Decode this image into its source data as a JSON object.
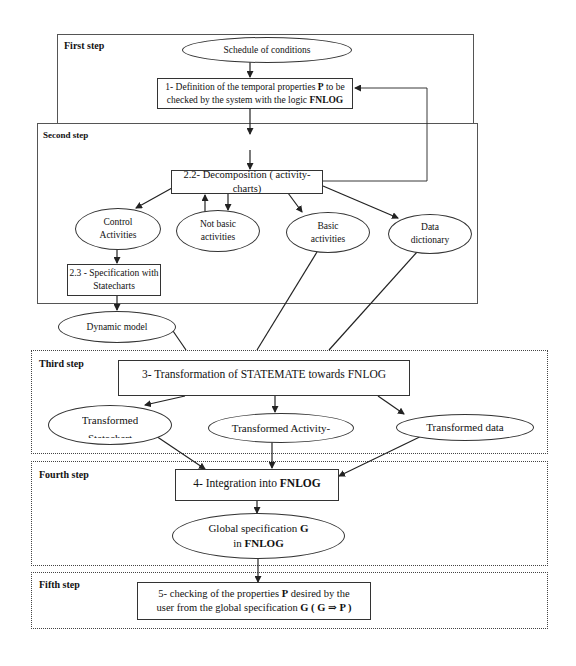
{
  "steps": {
    "first": "First step",
    "second": "Second step",
    "third": "Third step",
    "fourth": "Fourth step",
    "fifth": "Fifth step"
  },
  "nodes": {
    "schedule": "Schedule of conditions",
    "definition_line1_pre": "1- Definition of the temporal properties ",
    "definition_line1_bold": "P",
    "definition_line1_post": " to be",
    "definition_line2_pre": "checked by the system with the logic ",
    "definition_line2_bold": "FNLOG",
    "decomposition": "2.2- Decomposition  ( activity-charts)",
    "control_activities_1": "Control",
    "control_activities_2": "Activities",
    "not_basic_1": "Not basic",
    "not_basic_2": "activities",
    "basic_1": "Basic",
    "basic_2": "activities",
    "data_dict_1": "Data",
    "data_dict_2": "dictionary",
    "spec_statecharts_1": "2.3 - Specification with",
    "spec_statecharts_2": "Statecharts",
    "dynamic_model": "Dynamic model",
    "transformation": "3- Transformation of STATEMATE towards FNLOG",
    "transformed_statechart_1": "Transformed",
    "transformed_statechart_2": "Statechart",
    "transformed_activity": "Transformed Activity-",
    "transformed_data": "Transformed data",
    "integration_pre": "4- Integration into ",
    "integration_bold": "FNLOG",
    "global_spec_1_pre": "Global specification  ",
    "global_spec_1_bold": "G",
    "global_spec_2_pre": "in ",
    "global_spec_2_bold": "FNLOG",
    "checking_line1_pre": "5- checking  of the properties ",
    "checking_line1_bold": "P",
    "checking_line1_post": " desired by the",
    "checking_line2_pre": "user from the global specification  ",
    "checking_line2_bold": "G ( G ⇒ P )"
  },
  "colors": {
    "line": "#222222",
    "background": "#ffffff"
  }
}
